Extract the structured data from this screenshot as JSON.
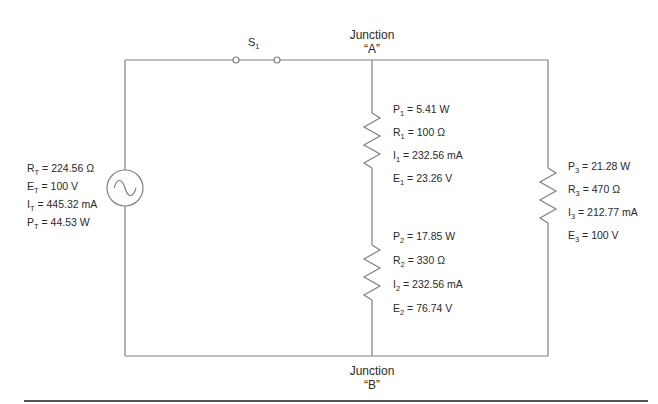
{
  "colors": {
    "wire": "#808080",
    "text": "#2a2a2a",
    "rule": "#555555"
  },
  "switch": {
    "label": "S",
    "sub": "1"
  },
  "junction_a": {
    "line1": "Junction",
    "line2": "“A”"
  },
  "junction_b": {
    "line1": "Junction",
    "line2": "“B”"
  },
  "source": {
    "icon": "ac-source-icon",
    "values": [
      {
        "sym": "R",
        "sub": "T",
        "text": " = 224.56 Ω"
      },
      {
        "sym": "E",
        "sub": "T",
        "text": " = 100 V"
      },
      {
        "sym": "I",
        "sub": "T",
        "text": " = 445.32 mA"
      },
      {
        "sym": "P",
        "sub": "T",
        "text": " = 44.53 W"
      }
    ]
  },
  "r1": {
    "values": [
      {
        "sym": "P",
        "sub": "1",
        "text": " = 5.41 W"
      },
      {
        "sym": "R",
        "sub": "1",
        "text": " = 100 Ω"
      },
      {
        "sym": "I",
        "sub": "1",
        "text": " = 232.56 mA"
      },
      {
        "sym": "E",
        "sub": "1",
        "text": " = 23.26 V"
      }
    ]
  },
  "r2": {
    "values": [
      {
        "sym": "P",
        "sub": "2",
        "text": " = 17.85 W"
      },
      {
        "sym": "R",
        "sub": "2",
        "text": " = 330 Ω"
      },
      {
        "sym": "I",
        "sub": "2",
        "text": " = 232.56 mA"
      },
      {
        "sym": "E",
        "sub": "2",
        "text": " = 76.74 V"
      }
    ]
  },
  "r3": {
    "values": [
      {
        "sym": "P",
        "sub": "3",
        "text": " = 21.28 W"
      },
      {
        "sym": "R",
        "sub": "3",
        "text": " = 470 Ω"
      },
      {
        "sym": "I",
        "sub": "3",
        "text": " = 212.77 mA"
      },
      {
        "sym": "E",
        "sub": "3",
        "text": " = 100 V"
      }
    ]
  }
}
